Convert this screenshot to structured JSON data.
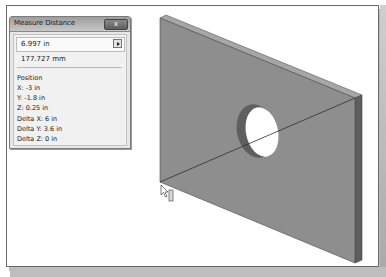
{
  "dialog": {
    "title": "Measure Distance",
    "close_label": "x",
    "distance_in": "6.997 in",
    "distance_mm": "177.727 mm",
    "position_label": "Position",
    "rows": [
      "X: -3 in",
      "Y: -1.8 in",
      "Z: 0.25 in",
      "Delta X: 6 in",
      "Delta Y: 3.6 in",
      "Delta Z: 0 in"
    ]
  },
  "viewport": {
    "model": "rectangular plate with circular hole",
    "measure_line": "diagonal from bottom-left corner to top-right corner",
    "colors": {
      "face": "#8c8c8c",
      "top_edge": "#a3a3a3",
      "side_edge": "#5c5c5c",
      "hole_wall": "#6a6a6a",
      "line": "#333333"
    }
  },
  "cursor": {
    "icon": "pointer-with-measure-icon"
  }
}
